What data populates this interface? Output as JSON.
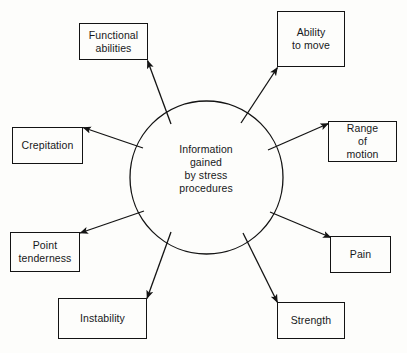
{
  "diagram": {
    "type": "radial-spoke",
    "title": "Information gained by stress procedures",
    "background_color": "#fdfdfb",
    "line_color": "#131313",
    "text_color": "#17181a",
    "center": {
      "label": "Information\ngained\nby stress\nprocedures",
      "shape": "circle"
    },
    "nodes": [
      {
        "id": "functional-abilities",
        "label": "Functional\nabilities"
      },
      {
        "id": "ability-to-move",
        "label": "Ability\nto move"
      },
      {
        "id": "range-of-motion",
        "label": "Range\nof\nmotion"
      },
      {
        "id": "pain",
        "label": "Pain"
      },
      {
        "id": "strength",
        "label": "Strength"
      },
      {
        "id": "instability",
        "label": "Instability"
      },
      {
        "id": "point-tenderness",
        "label": "Point\ntenderness"
      },
      {
        "id": "crepitation",
        "label": "Crepitation"
      }
    ]
  }
}
